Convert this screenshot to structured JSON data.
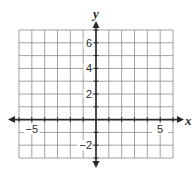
{
  "chart_data": {
    "type": "coordinate-grid",
    "title": "",
    "xlabel": "x",
    "ylabel": "y",
    "xlim": [
      -6,
      6
    ],
    "ylim": [
      -3,
      7
    ],
    "grid": true,
    "grid_step": 1,
    "x_tick_labels": [
      {
        "value": -5,
        "label": "−5"
      },
      {
        "value": 5,
        "label": "5"
      }
    ],
    "y_tick_labels": [
      {
        "value": 6,
        "label": "6"
      },
      {
        "value": 4,
        "label": "4"
      },
      {
        "value": 2,
        "label": "2"
      },
      {
        "value": -2,
        "label": "−2"
      }
    ],
    "series": [],
    "colors": {
      "grid": "#8c8c8c",
      "axis": "#2a2a2a",
      "text": "#2a2a2a"
    }
  },
  "axes": {
    "x_name": "x",
    "y_name": "y"
  }
}
